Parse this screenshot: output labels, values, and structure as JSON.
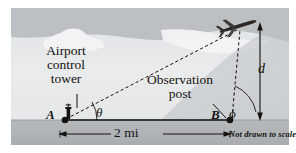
{
  "figure": {
    "caption_note": "Not drawn to scale",
    "labels": {
      "tower": "Airport\ncontrol\ntower",
      "observation_post": "Observation\npost",
      "point_a": "A",
      "point_b": "B",
      "angle_theta": "θ",
      "angle_phi": "ϕ",
      "altitude": "d",
      "baseline": "2 mi"
    },
    "icons": {
      "airplane": "airplane-icon",
      "control_tower": "control-tower-icon",
      "cloud": "cloud-icon"
    },
    "colors": {
      "sky_light": "#e6e9ea",
      "sky_band": "#b9bdc0",
      "cloud": "#f4f5f5",
      "ground": "#b0b4b7",
      "ink": "#15120f",
      "page": "#ffffff"
    },
    "geometry": {
      "point_a": [
        52,
        112
      ],
      "point_b": [
        219,
        112
      ],
      "plane": [
        228,
        18
      ],
      "baseline_miles": 2,
      "ground_y": 112
    }
  }
}
